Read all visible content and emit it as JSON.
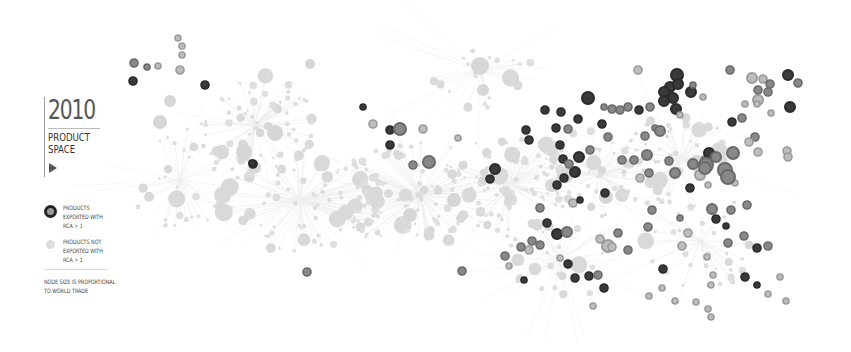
{
  "header": {
    "year": "2010",
    "title_line1": "PRODUCT",
    "title_line2": "SPACE",
    "play_icon": "play-triangle-icon"
  },
  "legend": {
    "exported": "PRODUCTS\nEXPORTED WITH\nRCA > 1",
    "not_exported": "PRODUCTS NOT\nEXPORTED WITH\nRCA > 1",
    "note": "NODE SIZE IS PROPORTIONAL\nTO WORLD TRADE"
  },
  "colors": {
    "background": "#ffffff",
    "link": "#ececec",
    "node_not_exported": "#dcdcdc",
    "node_exported_dark": "#2a2a2a",
    "node_exported_mid": "#6a6a6a",
    "node_exported_light": "#9a9a9a"
  },
  "graph": {
    "rca_nodes": [
      [
        134,
        63,
        4,
        "mid"
      ],
      [
        147,
        67,
        3,
        "mid"
      ],
      [
        158,
        66,
        3,
        "light"
      ],
      [
        178,
        38,
        3,
        "light"
      ],
      [
        182,
        46,
        3,
        "light"
      ],
      [
        182,
        55,
        3,
        "light"
      ],
      [
        180,
        70,
        4,
        "light"
      ],
      [
        133,
        81,
        4,
        "dark"
      ],
      [
        205,
        85,
        4,
        "dark"
      ],
      [
        253,
        164,
        4,
        "dark"
      ],
      [
        252,
        163,
        3,
        "dark"
      ],
      [
        307,
        272,
        4,
        "mid"
      ],
      [
        363,
        107,
        3,
        "dark"
      ],
      [
        390,
        130,
        4,
        "dark"
      ],
      [
        400,
        129,
        6,
        "mid"
      ],
      [
        390,
        145,
        4,
        "dark"
      ],
      [
        373,
        124,
        4,
        "light"
      ],
      [
        423,
        129,
        4,
        "light"
      ],
      [
        458,
        138,
        3,
        "light"
      ],
      [
        429,
        162,
        6,
        "mid"
      ],
      [
        413,
        165,
        4,
        "mid"
      ],
      [
        495,
        169,
        5,
        "dark"
      ],
      [
        526,
        130,
        4,
        "dark"
      ],
      [
        529,
        140,
        4,
        "dark"
      ],
      [
        545,
        110,
        4,
        "dark"
      ],
      [
        561,
        112,
        4,
        "dark"
      ],
      [
        556,
        128,
        4,
        "dark"
      ],
      [
        568,
        129,
        4,
        "mid"
      ],
      [
        578,
        119,
        4,
        "dark"
      ],
      [
        560,
        145,
        4,
        "dark"
      ],
      [
        563,
        159,
        4,
        "dark"
      ],
      [
        588,
        98,
        6,
        "dark"
      ],
      [
        604,
        107,
        3,
        "mid"
      ],
      [
        612,
        109,
        4,
        "mid"
      ],
      [
        620,
        110,
        4,
        "mid"
      ],
      [
        628,
        107,
        4,
        "mid"
      ],
      [
        639,
        110,
        4,
        "dark"
      ],
      [
        650,
        107,
        4,
        "mid"
      ],
      [
        677,
        75,
        6,
        "dark"
      ],
      [
        670,
        87,
        5,
        "dark"
      ],
      [
        678,
        84,
        5,
        "dark"
      ],
      [
        691,
        92,
        5,
        "dark"
      ],
      [
        664,
        92,
        5,
        "dark"
      ],
      [
        673,
        98,
        5,
        "dark"
      ],
      [
        664,
        101,
        5,
        "dark"
      ],
      [
        676,
        109,
        5,
        "dark"
      ],
      [
        638,
        70,
        4,
        "light"
      ],
      [
        693,
        85,
        3,
        "mid"
      ],
      [
        703,
        97,
        3,
        "light"
      ],
      [
        680,
        115,
        3,
        "light"
      ],
      [
        655,
        128,
        3,
        "mid"
      ],
      [
        645,
        136,
        4,
        "mid"
      ],
      [
        660,
        131,
        5,
        "mid"
      ],
      [
        602,
        124,
        4,
        "dark"
      ],
      [
        590,
        150,
        4,
        "mid"
      ],
      [
        608,
        137,
        4,
        "mid"
      ],
      [
        622,
        160,
        4,
        "mid"
      ],
      [
        647,
        155,
        5,
        "mid"
      ],
      [
        649,
        173,
        4,
        "mid"
      ],
      [
        640,
        178,
        4,
        "light"
      ],
      [
        634,
        160,
        4,
        "mid"
      ],
      [
        669,
        161,
        4,
        "mid"
      ],
      [
        675,
        173,
        5,
        "mid"
      ],
      [
        693,
        164,
        5,
        "mid"
      ],
      [
        700,
        175,
        5,
        "light"
      ],
      [
        705,
        160,
        4,
        "mid"
      ],
      [
        709,
        153,
        5,
        "dark"
      ],
      [
        716,
        157,
        5,
        "mid"
      ],
      [
        706,
        165,
        7,
        "mid"
      ],
      [
        705,
        168,
        6,
        "mid"
      ],
      [
        725,
        170,
        7,
        "mid"
      ],
      [
        733,
        153,
        6,
        "mid"
      ],
      [
        708,
        185,
        3,
        "light"
      ],
      [
        735,
        183,
        3,
        "light"
      ],
      [
        730,
        70,
        4,
        "mid"
      ],
      [
        752,
        78,
        5,
        "light"
      ],
      [
        763,
        79,
        4,
        "light"
      ],
      [
        770,
        84,
        4,
        "mid"
      ],
      [
        758,
        90,
        4,
        "mid"
      ],
      [
        768,
        92,
        4,
        "mid"
      ],
      [
        758,
        100,
        5,
        "light"
      ],
      [
        788,
        75,
        5,
        "dark"
      ],
      [
        798,
        83,
        4,
        "mid"
      ],
      [
        790,
        107,
        5,
        "dark"
      ],
      [
        757,
        104,
        3,
        "light"
      ],
      [
        771,
        113,
        3,
        "light"
      ],
      [
        755,
        137,
        4,
        "mid"
      ],
      [
        732,
        122,
        4,
        "dark"
      ],
      [
        742,
        118,
        4,
        "mid"
      ],
      [
        749,
        142,
        4,
        "light"
      ],
      [
        758,
        152,
        4,
        "light"
      ],
      [
        787,
        151,
        4,
        "light"
      ],
      [
        788,
        157,
        4,
        "light"
      ],
      [
        728,
        177,
        7,
        "mid"
      ],
      [
        712,
        209,
        5,
        "mid"
      ],
      [
        716,
        219,
        4,
        "dark"
      ],
      [
        726,
        226,
        3,
        "dark"
      ],
      [
        744,
        236,
        4,
        "mid"
      ],
      [
        728,
        243,
        4,
        "mid"
      ],
      [
        757,
        248,
        4,
        "dark"
      ],
      [
        745,
        277,
        4,
        "dark"
      ],
      [
        757,
        285,
        3,
        "dark"
      ],
      [
        707,
        257,
        3,
        "light"
      ],
      [
        713,
        275,
        3,
        "light"
      ],
      [
        711,
        285,
        3,
        "light"
      ],
      [
        747,
        205,
        4,
        "mid"
      ],
      [
        768,
        246,
        4,
        "mid"
      ],
      [
        780,
        277,
        3,
        "light"
      ],
      [
        768,
        294,
        3,
        "light"
      ],
      [
        786,
        301,
        3,
        "light"
      ],
      [
        540,
        208,
        4,
        "mid"
      ],
      [
        547,
        223,
        4,
        "dark"
      ],
      [
        557,
        185,
        4,
        "dark"
      ],
      [
        564,
        178,
        4,
        "dark"
      ],
      [
        575,
        172,
        5,
        "dark"
      ],
      [
        579,
        157,
        5,
        "dark"
      ],
      [
        569,
        164,
        4,
        "mid"
      ],
      [
        532,
        241,
        4,
        "mid"
      ],
      [
        540,
        245,
        4,
        "mid"
      ],
      [
        529,
        250,
        4,
        "light"
      ],
      [
        557,
        234,
        5,
        "dark"
      ],
      [
        567,
        232,
        5,
        "mid"
      ],
      [
        568,
        264,
        4,
        "dark"
      ],
      [
        575,
        278,
        4,
        "dark"
      ],
      [
        589,
        276,
        4,
        "dark"
      ],
      [
        598,
        275,
        4,
        "mid"
      ],
      [
        604,
        288,
        4,
        "dark"
      ],
      [
        608,
        246,
        6,
        "light"
      ],
      [
        618,
        233,
        4,
        "mid"
      ],
      [
        524,
        280,
        3,
        "dark"
      ],
      [
        593,
        306,
        3,
        "light"
      ],
      [
        663,
        269,
        4,
        "dark"
      ],
      [
        662,
        288,
        3,
        "light"
      ],
      [
        649,
        296,
        3,
        "light"
      ],
      [
        675,
        301,
        3,
        "light"
      ],
      [
        696,
        302,
        3,
        "light"
      ],
      [
        708,
        309,
        3,
        "light"
      ],
      [
        711,
        317,
        3,
        "light"
      ],
      [
        682,
        246,
        4,
        "light"
      ],
      [
        688,
        233,
        4,
        "light"
      ],
      [
        731,
        210,
        4,
        "mid"
      ],
      [
        462,
        271,
        4,
        "mid"
      ],
      [
        505,
        256,
        4,
        "mid"
      ],
      [
        509,
        266,
        3,
        "light"
      ],
      [
        521,
        247,
        4,
        "mid"
      ],
      [
        490,
        179,
        4,
        "dark"
      ],
      [
        573,
        203,
        4,
        "light"
      ],
      [
        600,
        239,
        4,
        "light"
      ],
      [
        612,
        247,
        4,
        "light"
      ],
      [
        628,
        250,
        4,
        "mid"
      ],
      [
        680,
        218,
        3,
        "mid"
      ],
      [
        652,
        210,
        4,
        "mid"
      ],
      [
        648,
        227,
        4,
        "mid"
      ],
      [
        690,
        188,
        4,
        "dark"
      ],
      [
        745,
        104,
        3,
        "light"
      ],
      [
        605,
        193,
        4,
        "dark"
      ],
      [
        580,
        200,
        3,
        "dark"
      ],
      [
        560,
        258,
        3,
        "light"
      ]
    ]
  }
}
